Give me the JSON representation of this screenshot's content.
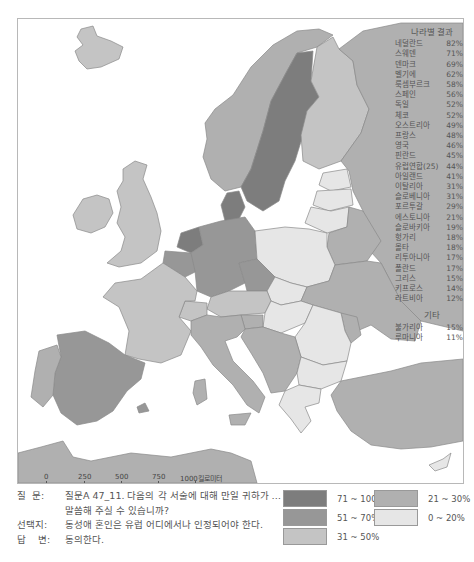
{
  "results": {
    "title": "나라별 결과",
    "countries": [
      {
        "name": "네덜란드",
        "value": "82%"
      },
      {
        "name": "스웨덴",
        "value": "71%"
      },
      {
        "name": "덴마크",
        "value": "69%"
      },
      {
        "name": "벨기에",
        "value": "62%"
      },
      {
        "name": "룩셈부르크",
        "value": "58%"
      },
      {
        "name": "스페인",
        "value": "56%"
      },
      {
        "name": "독일",
        "value": "52%"
      },
      {
        "name": "체코",
        "value": "52%"
      },
      {
        "name": "오스트리아",
        "value": "49%"
      },
      {
        "name": "프랑스",
        "value": "48%"
      },
      {
        "name": "영국",
        "value": "46%"
      },
      {
        "name": "핀란드",
        "value": "45%"
      },
      {
        "name": "유럽연합(25)",
        "value": "44%"
      },
      {
        "name": "아일랜드",
        "value": "41%"
      },
      {
        "name": "이탈리아",
        "value": "31%"
      },
      {
        "name": "슬로베니아",
        "value": "31%"
      },
      {
        "name": "포르투갈",
        "value": "29%"
      },
      {
        "name": "에스토니아",
        "value": "21%"
      },
      {
        "name": "슬로바키아",
        "value": "19%"
      },
      {
        "name": "헝가리",
        "value": "18%"
      },
      {
        "name": "몰타",
        "value": "18%"
      },
      {
        "name": "리투아니아",
        "value": "17%"
      },
      {
        "name": "폴란드",
        "value": "17%"
      },
      {
        "name": "그리스",
        "value": "15%"
      },
      {
        "name": "키프로스",
        "value": "14%"
      },
      {
        "name": "라트비아",
        "value": "12%"
      }
    ],
    "other_title": "기타",
    "other": [
      {
        "name": "불가리아",
        "value": "15%"
      },
      {
        "name": "루마니아",
        "value": "11%"
      }
    ]
  },
  "scale": {
    "km_labels": [
      "0",
      "250",
      "500",
      "750",
      "1000킬로미터"
    ],
    "mile_labels": [
      "0",
      "250",
      "500마일"
    ]
  },
  "caption": {
    "question_key": "질  문:",
    "question_line1": "질문A 47_11. 다음의 각 서술에 대해 만일 귀하가 …",
    "question_line2": "말씀해 주실 수 있습니까?",
    "statement_key": "선택지:",
    "statement": "동성애 혼인은 유럽 어디에서나 인정되어야 한다.",
    "answer_key": "답    변:",
    "answer": "동의한다."
  },
  "legend": {
    "items": [
      {
        "label": "71 ~ 100%",
        "color": "#7d7d7d"
      },
      {
        "label": "51 ~ 70%",
        "color": "#979797"
      },
      {
        "label": "31 ~ 50%",
        "color": "#c4c4c4"
      },
      {
        "label": "21 ~ 30%",
        "color": "#b0b0b0"
      },
      {
        "label": "0 ~ 20%",
        "color": "#e6e6e6"
      }
    ]
  }
}
